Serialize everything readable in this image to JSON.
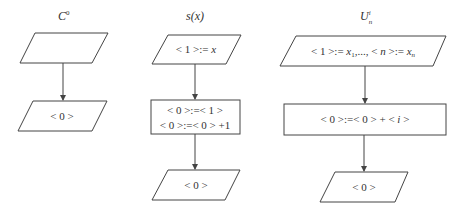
{
  "diagram": {
    "type": "flowchart-set",
    "flowcharts": [
      {
        "id": "c0",
        "title": {
          "base": "C",
          "sup": "0",
          "sub": ""
        },
        "nodes": [
          {
            "kind": "io",
            "label": ""
          },
          {
            "kind": "io",
            "label": "< 0 >"
          }
        ],
        "edges": [
          {
            "from": 0,
            "to": 1
          }
        ]
      },
      {
        "id": "s",
        "title": {
          "base": "s(x)",
          "sup": "",
          "sub": ""
        },
        "nodes": [
          {
            "kind": "io",
            "label_pre": "< 1 >:= ",
            "label_var": "x"
          },
          {
            "kind": "process",
            "lines": [
              "< 0 >:=< 1 >",
              "< 0 >:=< 0 > +1"
            ]
          },
          {
            "kind": "io",
            "label": "< 0 >"
          }
        ],
        "edges": [
          {
            "from": 0,
            "to": 1
          },
          {
            "from": 1,
            "to": 2
          }
        ]
      },
      {
        "id": "u",
        "title": {
          "base": "U",
          "sup": "i",
          "sub": "n"
        },
        "nodes": [
          {
            "kind": "io",
            "parts": [
              "< 1 >:= ",
              "x",
              "1",
              ",..., < ",
              "n",
              " >:= ",
              "x",
              "n"
            ]
          },
          {
            "kind": "process",
            "parts": [
              "< 0 >:=< 0 > + < ",
              "i",
              " >"
            ]
          },
          {
            "kind": "io",
            "label": "< 0 >"
          }
        ],
        "edges": [
          {
            "from": 0,
            "to": 1
          },
          {
            "from": 1,
            "to": 2
          }
        ]
      }
    ],
    "colors": {
      "stroke": "#444444",
      "text": "#333333",
      "background": "#ffffff"
    }
  }
}
